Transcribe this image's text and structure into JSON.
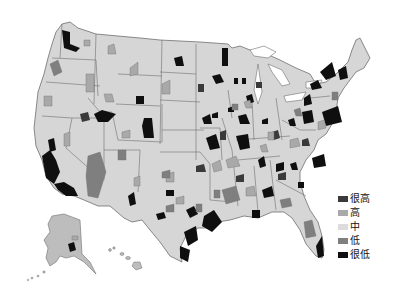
{
  "map": {
    "type": "choropleth",
    "region": "United States (counties/metro areas) with Alaska and Hawaii insets",
    "base_fill": "#d6d6d6",
    "border_color": "#6e6e6e"
  },
  "legend": {
    "items": [
      {
        "label": "很高",
        "color": "#3a3a3a"
      },
      {
        "label": "高",
        "color": "#a9a9a9"
      },
      {
        "label": "中",
        "color": "#dcdcdc"
      },
      {
        "label": "低",
        "color": "#7f7f7f"
      },
      {
        "label": "很低",
        "color": "#0f0f0f"
      }
    ]
  }
}
